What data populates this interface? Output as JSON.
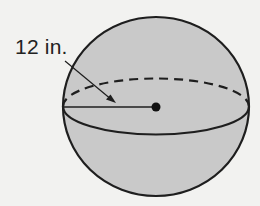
{
  "diagram": {
    "shape": "sphere",
    "radius_label": "12 in.",
    "colors": {
      "background": "#f2f2f0",
      "sphere_fill": "#c9c9c9",
      "stroke": "#1e1e1e"
    }
  }
}
